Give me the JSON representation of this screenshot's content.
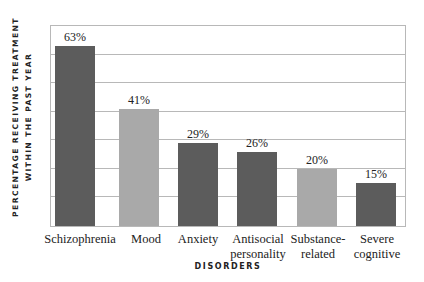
{
  "chart_data": {
    "type": "bar",
    "title": "",
    "xlabel": "DISORDERS",
    "ylabel_line1": "PERCENTAGE RECEIVING TREATMENT",
    "ylabel_line2": "WITHIN THE PAST YEAR",
    "categories": [
      "Schizophrenia",
      "Mood",
      "Anxiety",
      "Antisocial personality",
      "Substance-related",
      "Severe cognitive"
    ],
    "category_lines": [
      [
        "Schizophrenia"
      ],
      [
        "Mood"
      ],
      [
        "Anxiety"
      ],
      [
        "Antisocial",
        "personality"
      ],
      [
        "Substance-",
        "related"
      ],
      [
        "Severe",
        "cognitive"
      ]
    ],
    "values": [
      63,
      41,
      29,
      26,
      20,
      15
    ],
    "value_labels": [
      "63%",
      "41%",
      "29%",
      "26%",
      "20%",
      "15%"
    ],
    "bar_colors": [
      "#5c5c5c",
      "#a9a9a9",
      "#5c5c5c",
      "#5c5c5c",
      "#a9a9a9",
      "#5c5c5c"
    ],
    "ylim": [
      0,
      70
    ],
    "grid": true,
    "grid_step": 10,
    "y_tick_labels_shown": false,
    "legend": null
  }
}
